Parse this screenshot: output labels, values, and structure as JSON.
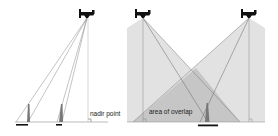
{
  "figure": {
    "left_panel": {
      "title": "relief displacement",
      "labels": {
        "nadir": "nadir point"
      },
      "aircraft": {
        "x": 87,
        "y": 14
      },
      "ground_y": 122,
      "towers": [
        {
          "x": 28,
          "height": 22,
          "bar_x1": 17,
          "bar_x2": 28
        },
        {
          "x": 61,
          "height": 22,
          "bar_x1": 57,
          "bar_x2": 62
        }
      ]
    },
    "right_panel": {
      "labels": {
        "overlap": "area of overlap"
      },
      "aircraft_left": {
        "x": 143,
        "y": 14
      },
      "aircraft_right": {
        "x": 249,
        "y": 14
      },
      "ground_y": 122,
      "tower": {
        "x": 207,
        "bar_x1": 198,
        "bar_x2": 218
      }
    },
    "colors": {
      "cone_fill": "#d9d9d9",
      "overlap_fill": "#bdbdbd",
      "line": "#6e6e6e",
      "ink": "#111111"
    }
  }
}
